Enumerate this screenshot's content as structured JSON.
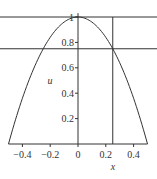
{
  "chart_data": {
    "type": "line",
    "title": "",
    "xlabel": "x",
    "ylabel": "u",
    "xlim": [
      -0.5,
      0.5
    ],
    "ylim": [
      0,
      1
    ],
    "grid": false,
    "legend": null,
    "x_ticks": [
      "-0.4",
      "-0.2",
      "0",
      "0.2",
      "0.4"
    ],
    "y_ticks": [
      "0.2",
      "0.4",
      "0.6",
      "0.8",
      "1"
    ],
    "series": [
      {
        "name": "u = 1 - 4x^2",
        "x": [
          -0.5,
          -0.4,
          -0.3,
          -0.2,
          -0.1,
          0,
          0.1,
          0.2,
          0.3,
          0.4,
          0.5
        ],
        "values": [
          0,
          0.36,
          0.64,
          0.84,
          0.96,
          1,
          0.96,
          0.84,
          0.64,
          0.36,
          0
        ]
      }
    ],
    "reference_lines": [
      {
        "orientation": "horizontal",
        "value": 1
      },
      {
        "orientation": "horizontal",
        "value": 0.75
      },
      {
        "orientation": "vertical",
        "value": 0.25
      }
    ]
  }
}
